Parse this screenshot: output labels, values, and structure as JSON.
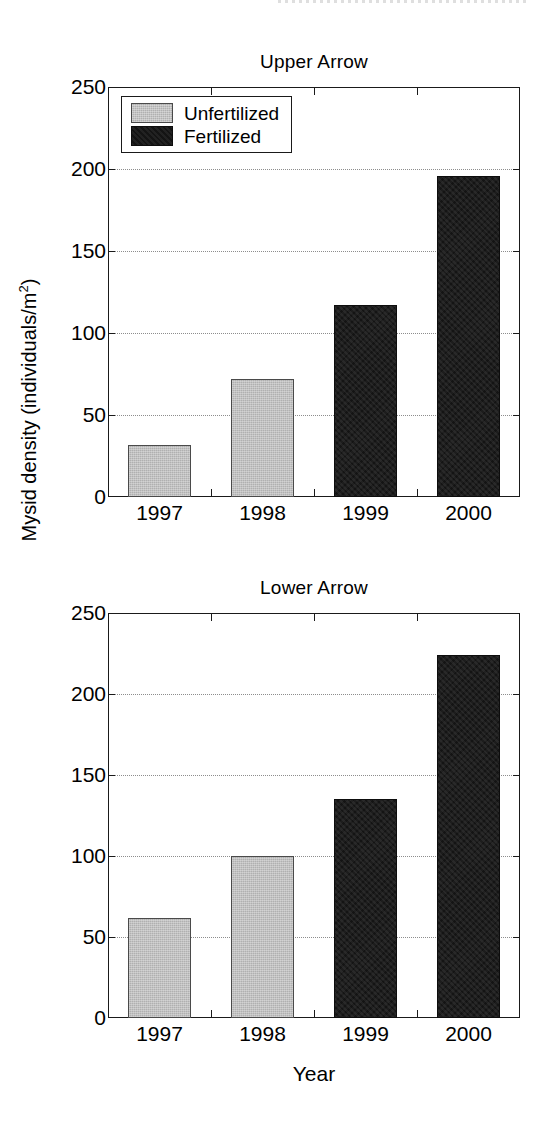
{
  "figure": {
    "y_axis_title_main": "Mysid density (individuals/m",
    "y_axis_title_sup": "2",
    "y_axis_title_close": ")",
    "x_axis_title": "Year",
    "legend": {
      "items": [
        {
          "label": "Unfertilized",
          "color": "#b0b0b0",
          "swatch": "gray-square-swatch"
        },
        {
          "label": "Fertilized",
          "color": "#141414",
          "swatch": "black-square-swatch"
        }
      ]
    },
    "y_ticks": [
      "0",
      "50",
      "100",
      "150",
      "200",
      "250"
    ],
    "grid": "dotted-horizontal",
    "panels": [
      {
        "title": "Upper Arrow"
      },
      {
        "title": "Lower Arrow"
      }
    ]
  },
  "chart_data": [
    {
      "type": "bar",
      "title": "Upper Arrow",
      "xlabel": "",
      "ylabel": "Mysid density (individuals/m2)",
      "categories": [
        "1997",
        "1998",
        "1999",
        "2000"
      ],
      "values": [
        32,
        72,
        117,
        196
      ],
      "bar_treatment": [
        "Unfertilized",
        "Unfertilized",
        "Fertilized",
        "Fertilized"
      ],
      "ylim": [
        0,
        250
      ],
      "ytick_interval": 50,
      "grid": true,
      "legend_position": "upper-left",
      "series": [
        {
          "name": "Unfertilized",
          "categories": [
            "1997",
            "1998"
          ],
          "values": [
            32,
            72
          ]
        },
        {
          "name": "Fertilized",
          "categories": [
            "1999",
            "2000"
          ],
          "values": [
            117,
            196
          ]
        }
      ]
    },
    {
      "type": "bar",
      "title": "Lower Arrow",
      "xlabel": "Year",
      "ylabel": "Mysid density (individuals/m2)",
      "categories": [
        "1997",
        "1998",
        "1999",
        "2000"
      ],
      "values": [
        62,
        100,
        135,
        224
      ],
      "bar_treatment": [
        "Unfertilized",
        "Unfertilized",
        "Fertilized",
        "Fertilized"
      ],
      "ylim": [
        0,
        250
      ],
      "ytick_interval": 50,
      "grid": true,
      "legend_position": "none",
      "series": [
        {
          "name": "Unfertilized",
          "categories": [
            "1997",
            "1998"
          ],
          "values": [
            62,
            100
          ]
        },
        {
          "name": "Fertilized",
          "categories": [
            "1999",
            "2000"
          ],
          "values": [
            135,
            224
          ]
        }
      ]
    }
  ]
}
